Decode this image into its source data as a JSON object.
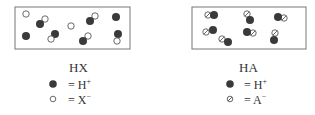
{
  "panels": [
    {
      "title": "HX",
      "legend": [
        {
          "symbol": "dark-circle",
          "eq": "= H",
          "charge": "+"
        },
        {
          "symbol": "hollow-circle",
          "eq": "= X",
          "charge": "−"
        }
      ]
    },
    {
      "title": "HA",
      "legend": [
        {
          "symbol": "dark-circle",
          "eq": "= H",
          "charge": "+"
        },
        {
          "symbol": "slashed-circle",
          "eq": "= A",
          "charge": "−"
        }
      ]
    }
  ],
  "colors": {
    "dark": "#3a3a3a",
    "border": "#666666",
    "text": "#333333"
  }
}
